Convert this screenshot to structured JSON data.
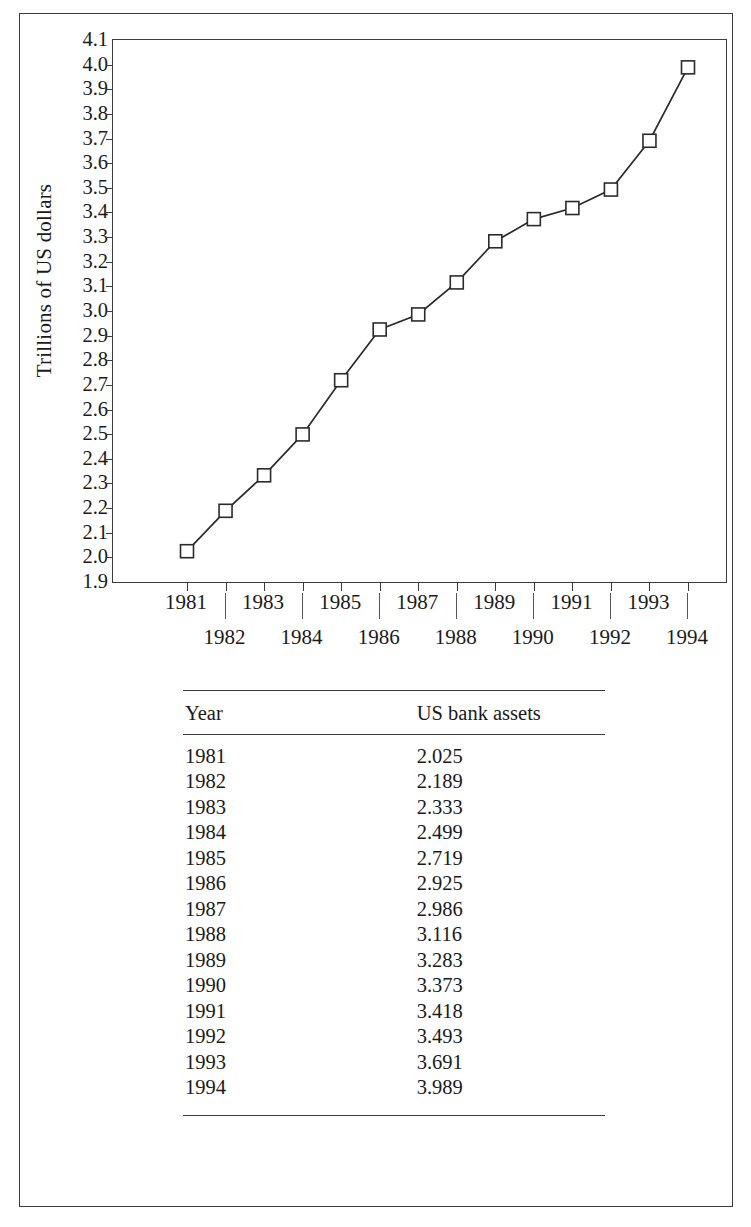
{
  "chart_data": {
    "type": "line",
    "title": "",
    "xlabel": "",
    "ylabel": "Trillions of US dollars",
    "categories": [
      "1981",
      "1982",
      "1983",
      "1984",
      "1985",
      "1986",
      "1987",
      "1988",
      "1989",
      "1990",
      "1991",
      "1992",
      "1993",
      "1994"
    ],
    "values": [
      2.025,
      2.189,
      2.333,
      2.499,
      2.719,
      2.925,
      2.986,
      3.116,
      3.283,
      3.373,
      3.418,
      3.493,
      3.691,
      3.989
    ],
    "series": [
      {
        "name": "US bank assets",
        "values": [
          2.025,
          2.189,
          2.333,
          2.499,
          2.719,
          2.925,
          2.986,
          3.116,
          3.283,
          3.373,
          3.418,
          3.493,
          3.691,
          3.989
        ]
      }
    ],
    "ylim": [
      1.9,
      4.1
    ],
    "ytick_labels": [
      "4.1",
      "4.0",
      "3.9",
      "3.8",
      "3.7",
      "3.6",
      "3.5",
      "3.4",
      "3.3",
      "3.2",
      "3.1",
      "3.0",
      "2.9",
      "2.8",
      "2.7",
      "2.6",
      "2.5",
      "2.4",
      "2.3",
      "2.2",
      "2.1",
      "2.0",
      "1.9"
    ],
    "ytick_values": [
      4.1,
      4.0,
      3.9,
      3.8,
      3.7,
      3.6,
      3.5,
      3.4,
      3.3,
      3.2,
      3.1,
      3.0,
      2.9,
      2.8,
      2.7,
      2.6,
      2.5,
      2.4,
      2.3,
      2.2,
      2.1,
      2.0,
      1.9
    ],
    "xtick_labels": [
      "1981",
      "1982",
      "1983",
      "1984",
      "1985",
      "1986",
      "1987",
      "1988",
      "1989",
      "1990",
      "1991",
      "1992",
      "1993",
      "1994"
    ],
    "grid": false,
    "legend": "none",
    "marker": "open-square",
    "line_color": "#2b2b2b",
    "marker_color": "#2b2b2b"
  },
  "table": {
    "columns": [
      "Year",
      "US bank assets"
    ],
    "rows": [
      {
        "year": "1981",
        "value": "2.025"
      },
      {
        "year": "1982",
        "value": "2.189"
      },
      {
        "year": "1983",
        "value": "2.333"
      },
      {
        "year": "1984",
        "value": "2.499"
      },
      {
        "year": "1985",
        "value": "2.719"
      },
      {
        "year": "1986",
        "value": "2.925"
      },
      {
        "year": "1987",
        "value": "2.986"
      },
      {
        "year": "1988",
        "value": "3.116"
      },
      {
        "year": "1989",
        "value": "3.283"
      },
      {
        "year": "1990",
        "value": "3.373"
      },
      {
        "year": "1991",
        "value": "3.418"
      },
      {
        "year": "1992",
        "value": "3.493"
      },
      {
        "year": "1993",
        "value": "3.691"
      },
      {
        "year": "1994",
        "value": "3.989"
      }
    ]
  }
}
